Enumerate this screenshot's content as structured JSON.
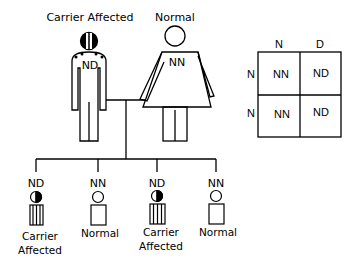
{
  "parents": {
    "father": {
      "phenotype": "Carrier Affected",
      "genotype": "ND"
    },
    "mother": {
      "phenotype": "Normal",
      "genotype": "NN"
    }
  },
  "children": [
    {
      "genotype": "ND",
      "phenotype_line1": "Carrier",
      "phenotype_line2": "Affected"
    },
    {
      "genotype": "NN",
      "phenotype_line1": "Normal",
      "phenotype_line2": ""
    },
    {
      "genotype": "ND",
      "phenotype_line1": "Carrier",
      "phenotype_line2": "Affected"
    },
    {
      "genotype": "NN",
      "phenotype_line1": "Normal",
      "phenotype_line2": ""
    }
  ],
  "punnett": {
    "col_headers": [
      "N",
      "D"
    ],
    "row_headers": [
      "N",
      "N"
    ],
    "cells": [
      [
        "NN",
        "ND"
      ],
      [
        "NN",
        "ND"
      ]
    ]
  },
  "colors": {
    "line": "#000000",
    "background": "#ffffff"
  }
}
